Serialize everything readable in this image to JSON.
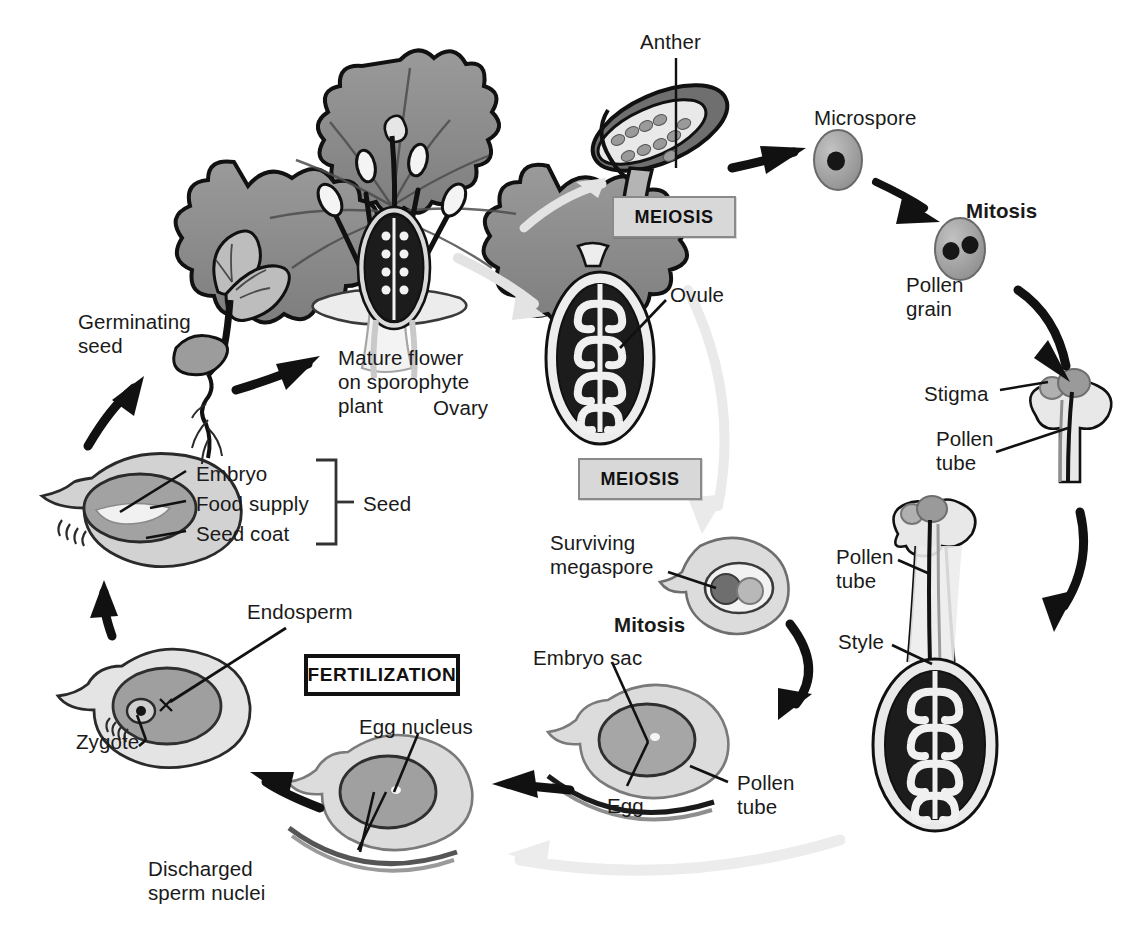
{
  "figure": {
    "type": "life-cycle-diagram",
    "background": "#ffffff",
    "ink_color": "#1a1a1a"
  },
  "stage_boxes": [
    {
      "id": "meiosis-male",
      "label": "MEIOSIS",
      "style": "gray",
      "x": 612,
      "y": 196,
      "w": 124,
      "h": 42
    },
    {
      "id": "meiosis-female",
      "label": "MEIOSIS",
      "style": "gray",
      "x": 578,
      "y": 458,
      "w": 124,
      "h": 42
    },
    {
      "id": "fertilization",
      "label": "FERTILIZATION",
      "style": "dark",
      "x": 304,
      "y": 654,
      "w": 156,
      "h": 42
    }
  ],
  "labels": [
    {
      "id": "anther",
      "text": "Anther",
      "x": 640,
      "y": 30,
      "bold": false
    },
    {
      "id": "microspore",
      "text": "Microspore",
      "x": 814,
      "y": 106,
      "bold": false
    },
    {
      "id": "mitosis-male",
      "text": "Mitosis",
      "x": 966,
      "y": 199,
      "bold": true
    },
    {
      "id": "pollen-grain",
      "text": "Pollen\ngrain",
      "x": 906,
      "y": 273,
      "bold": false
    },
    {
      "id": "stigma",
      "text": "Stigma",
      "x": 924,
      "y": 382,
      "bold": false
    },
    {
      "id": "pollen-tube-upper",
      "text": "Pollen\ntube",
      "x": 936,
      "y": 427,
      "bold": false
    },
    {
      "id": "pollen-tube-style",
      "text": "Pollen\ntube",
      "x": 836,
      "y": 545,
      "bold": false
    },
    {
      "id": "style",
      "text": "Style",
      "x": 838,
      "y": 630,
      "bold": false
    },
    {
      "id": "ovule",
      "text": "Ovule",
      "x": 670,
      "y": 283,
      "bold": false
    },
    {
      "id": "ovary",
      "text": "Ovary",
      "x": 433,
      "y": 396,
      "bold": false
    },
    {
      "id": "surviving-megaspore",
      "text": "Surviving\nmegaspore",
      "x": 550,
      "y": 531,
      "bold": false
    },
    {
      "id": "mitosis-female",
      "text": "Mitosis",
      "x": 614,
      "y": 613,
      "bold": true
    },
    {
      "id": "embryo-sac",
      "text": "Embryo sac",
      "x": 533,
      "y": 646,
      "bold": false
    },
    {
      "id": "egg",
      "text": "Egg",
      "x": 607,
      "y": 794,
      "bold": false
    },
    {
      "id": "pollen-tube-sac",
      "text": "Pollen\ntube",
      "x": 737,
      "y": 771,
      "bold": false
    },
    {
      "id": "egg-nucleus",
      "text": "Egg nucleus",
      "x": 359,
      "y": 715,
      "bold": false
    },
    {
      "id": "discharged-sperm-nuclei",
      "text": "Discharged\nsperm nuclei",
      "x": 148,
      "y": 857,
      "bold": false
    },
    {
      "id": "endosperm",
      "text": "Endosperm",
      "x": 247,
      "y": 600,
      "bold": false
    },
    {
      "id": "zygote",
      "text": "Zygote",
      "x": 76,
      "y": 730,
      "bold": false
    },
    {
      "id": "embryo",
      "text": "Embryo",
      "x": 196,
      "y": 462,
      "bold": false
    },
    {
      "id": "food-supply",
      "text": "Food supply",
      "x": 196,
      "y": 492,
      "bold": false
    },
    {
      "id": "seed-coat",
      "text": "Seed coat",
      "x": 196,
      "y": 522,
      "bold": false
    },
    {
      "id": "seed",
      "text": "Seed",
      "x": 363,
      "y": 492,
      "bold": false
    },
    {
      "id": "germinating-seed",
      "text": "Germinating\nseed",
      "x": 78,
      "y": 310,
      "bold": false
    },
    {
      "id": "mature-flower",
      "text": "Mature flower\non sporophyte\nplant",
      "x": 338,
      "y": 346,
      "bold": false
    }
  ],
  "structures": [
    {
      "id": "mature-flower-illustration",
      "name": "Mature flower on sporophyte plant"
    },
    {
      "id": "anther-illustration",
      "name": "Anther with pollen sacs"
    },
    {
      "id": "microspore-cell",
      "name": "Microspore (single nucleus)"
    },
    {
      "id": "pollen-grain-cell",
      "name": "Pollen grain (two nuclei)"
    },
    {
      "id": "stigma-carpel-top",
      "name": "Stigma with germinating pollen grain"
    },
    {
      "id": "carpel-with-pollen-tube",
      "name": "Carpel: stigma, style, ovary with ovules"
    },
    {
      "id": "ovary-illustration",
      "name": "Ovary containing ovules"
    },
    {
      "id": "megaspore-ovule",
      "name": "Ovule with surviving megaspore"
    },
    {
      "id": "embryo-sac-ovule",
      "name": "Ovule with embryo sac and pollen tube"
    },
    {
      "id": "fertilized-ovule",
      "name": "Ovule with egg nucleus and discharged sperm nuclei"
    },
    {
      "id": "zygote-ovule",
      "name": "Ovule with zygote and endosperm"
    },
    {
      "id": "seed-illustration",
      "name": "Seed: embryo, food supply, seed coat"
    },
    {
      "id": "germinating-seedling",
      "name": "Germinating seed / seedling"
    }
  ],
  "arrows": [
    {
      "id": "flower-to-anther",
      "style": "light-gray",
      "from": "mature-flower",
      "to": "anther"
    },
    {
      "id": "anther-to-microspore",
      "style": "black",
      "from": "anther",
      "to": "microspore"
    },
    {
      "id": "microspore-to-pollen-grain",
      "style": "black",
      "from": "microspore",
      "to": "pollen-grain"
    },
    {
      "id": "pollen-grain-to-stigma",
      "style": "black",
      "from": "pollen-grain",
      "to": "stigma"
    },
    {
      "id": "stigma-to-style",
      "style": "black",
      "from": "stigma",
      "to": "style"
    },
    {
      "id": "style-to-embryo-sac",
      "style": "black",
      "from": "style",
      "to": "embryo-sac"
    },
    {
      "id": "flower-to-ovary",
      "style": "light-gray",
      "from": "mature-flower",
      "to": "ovary"
    },
    {
      "id": "ovary-to-megaspore",
      "style": "light-gray",
      "from": "ovary",
      "to": "surviving-megaspore"
    },
    {
      "id": "megaspore-to-embryo-sac",
      "style": "black",
      "from": "surviving-megaspore",
      "to": "embryo-sac"
    },
    {
      "id": "embryo-sac-to-egg-nucleus",
      "style": "black",
      "from": "embryo-sac",
      "to": "egg-nucleus"
    },
    {
      "id": "egg-nucleus-to-zygote",
      "style": "black",
      "from": "egg-nucleus",
      "to": "zygote"
    },
    {
      "id": "zygote-to-seed",
      "style": "black",
      "from": "zygote",
      "to": "seed"
    },
    {
      "id": "seed-to-germinating",
      "style": "black",
      "from": "seed",
      "to": "germinating-seed"
    },
    {
      "id": "germinating-to-flower",
      "style": "black",
      "from": "germinating-seed",
      "to": "mature-flower"
    },
    {
      "id": "bottom-return",
      "style": "light-gray",
      "from": "pollen-tube-sac",
      "to": "fertilization"
    }
  ],
  "colors": {
    "ink": "#1a1a1a",
    "black_arrow": "#111111",
    "light_gray_arrow": "#e2e2e2",
    "petal_gray": "#8c8c8c",
    "pale_gray": "#d9d9d9",
    "mid_gray": "#a8a8a8",
    "dark_fill": "#1c1c1c",
    "box_fill": "#d8d8d8",
    "box_border": "#8a8a8a"
  }
}
